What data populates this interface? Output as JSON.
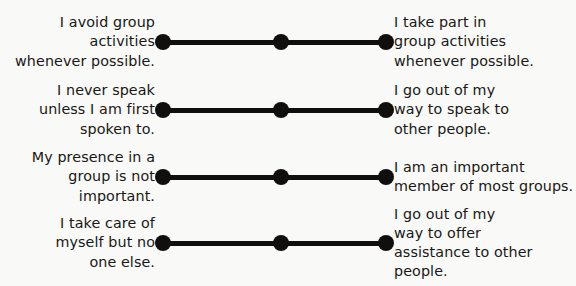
{
  "diagram": {
    "type": "bipolar-semantic-differential-scale",
    "title": "",
    "background_color": "#f9f9f7",
    "ink_color": "#100f0d",
    "points_per_scale": 3,
    "scale_count": 4,
    "items": [
      {
        "id": "group-activities",
        "left_statement": "I avoid group\nactivities\nwhenever possible.",
        "right_statement": "I take part in\ngroup activities\nwhenever possible.",
        "left_lines": 3,
        "right_lines": 3
      },
      {
        "id": "speaking-to-others",
        "left_statement": "I never speak\nunless I am first\nspoken to.",
        "right_statement": "I go out of my\nway to speak to\nother people.",
        "left_lines": 3,
        "right_lines": 3
      },
      {
        "id": "group-importance",
        "left_statement": "My presence in a\ngroup is not\nimportant.",
        "right_statement": "I am an important\nmember of most groups.",
        "left_lines": 3,
        "right_lines": 2
      },
      {
        "id": "offering-assistance",
        "left_statement": "I take care of\nmyself but no\none else.",
        "right_statement": "I go out of my\nway to offer\nassistance to other\npeople.",
        "left_lines": 3,
        "right_lines": 4
      }
    ]
  }
}
